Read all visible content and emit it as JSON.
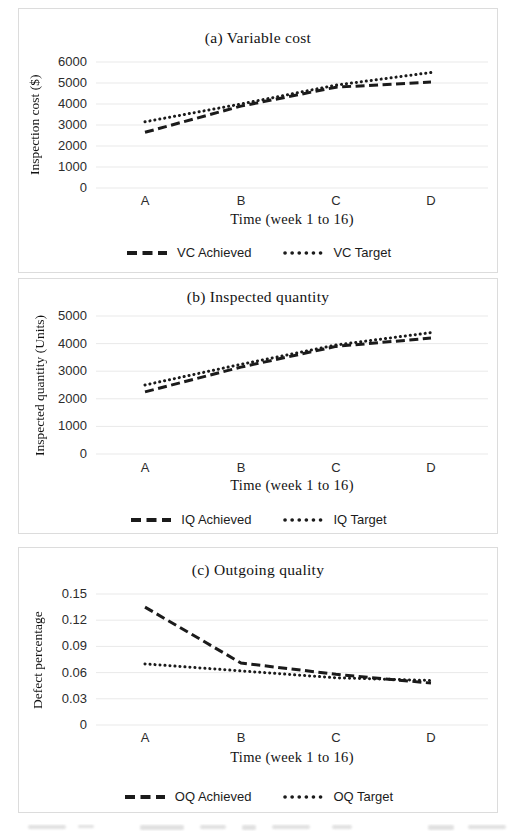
{
  "colors": {
    "line": "#1b1b1b",
    "grid": "#e9e9e9",
    "panel_border": "#dcdcdc",
    "tick_text": "#2c2c2c"
  },
  "chart_data": [
    {
      "type": "line",
      "title": "(a) Variable cost",
      "xlabel": "Time (week 1 to 16)",
      "ylabel": "Inspection cost ($)",
      "categories": [
        "A",
        "B",
        "C",
        "D"
      ],
      "series": [
        {
          "name": "VC Achieved",
          "style": "dashed",
          "values": [
            2650,
            3900,
            4800,
            5050
          ]
        },
        {
          "name": "VC Target",
          "style": "dotted",
          "values": [
            3150,
            4000,
            4900,
            5500
          ]
        }
      ],
      "ylim": [
        0,
        6000
      ],
      "yticks": [
        0,
        1000,
        2000,
        3000,
        4000,
        5000,
        6000
      ],
      "grid": true,
      "legend_position": "bottom"
    },
    {
      "type": "line",
      "title": "(b) Inspected quantity",
      "xlabel": "Time (week 1 to 16)",
      "ylabel": "Inspected quantity (Units)",
      "categories": [
        "A",
        "B",
        "C",
        "D"
      ],
      "series": [
        {
          "name": "IQ Achieved",
          "style": "dashed",
          "values": [
            2250,
            3150,
            3900,
            4200
          ]
        },
        {
          "name": "IQ Target",
          "style": "dotted",
          "values": [
            2500,
            3250,
            3950,
            4400
          ]
        }
      ],
      "ylim": [
        0,
        5000
      ],
      "yticks": [
        0,
        1000,
        2000,
        3000,
        4000,
        5000
      ],
      "grid": true,
      "legend_position": "bottom"
    },
    {
      "type": "line",
      "title": "(c) Outgoing quality",
      "xlabel": "Time (week 1 to 16)",
      "ylabel": "Defect percentage",
      "categories": [
        "A",
        "B",
        "C",
        "D"
      ],
      "series": [
        {
          "name": "OQ Achieved",
          "style": "dashed",
          "values": [
            0.135,
            0.071,
            0.058,
            0.048
          ]
        },
        {
          "name": "OQ Target",
          "style": "dotted",
          "values": [
            0.07,
            0.062,
            0.054,
            0.051
          ]
        }
      ],
      "ylim": [
        0,
        0.15
      ],
      "yticks": [
        0,
        0.03,
        0.06,
        0.09,
        0.12,
        0.15
      ],
      "grid": true,
      "legend_position": "bottom"
    }
  ]
}
